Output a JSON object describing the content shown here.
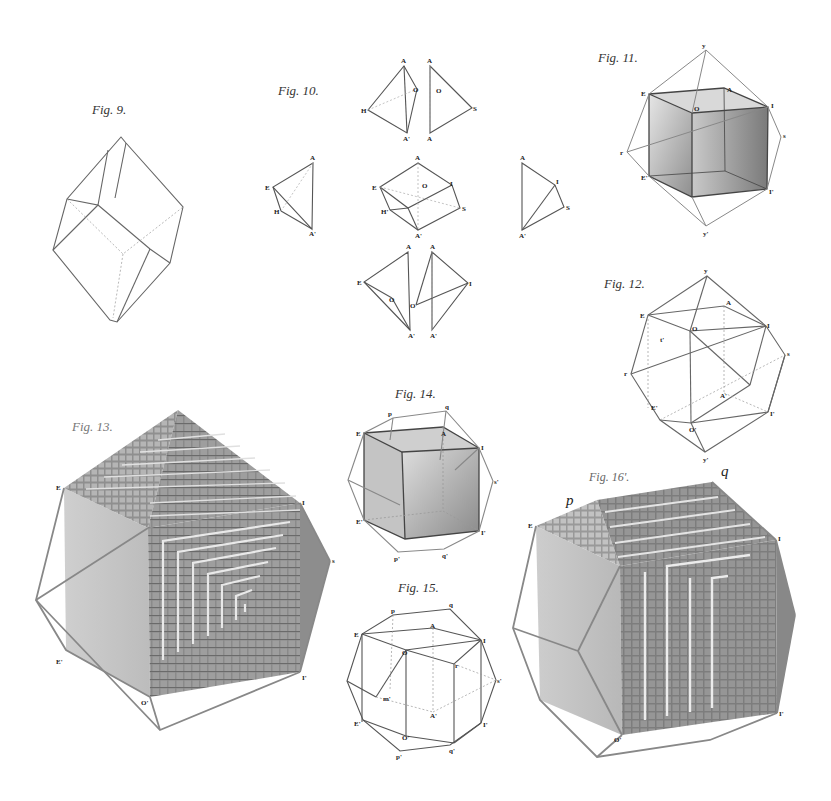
{
  "plate": {
    "subject": "Crystal structure figures",
    "figures": [
      {
        "id": "fig9",
        "label": "Fig. 9.",
        "kind": "rhombic prism outline, dotted hidden edges"
      },
      {
        "id": "fig10",
        "label": "Fig. 10.",
        "kind": "tetrahedral decomposition of octahedron",
        "vertex_labels": [
          "A",
          "A'",
          "O",
          "H",
          "S",
          "E",
          "I",
          "H'"
        ]
      },
      {
        "id": "fig11",
        "label": "Fig. 11.",
        "kind": "shaded cube inscribed in polyhedron",
        "vertex_labels": [
          "E",
          "O",
          "I",
          "E'",
          "I'"
        ]
      },
      {
        "id": "fig12",
        "label": "Fig. 12.",
        "kind": "cuboctahedral wireframe",
        "vertex_labels": [
          "E",
          "A",
          "O",
          "I",
          "E'",
          "I'",
          "A'"
        ]
      },
      {
        "id": "fig13",
        "label": "Fig. 13.",
        "kind": "stepped crystal growth on cube, decrement lamellae",
        "vertex_labels": [
          "E",
          "I",
          "E'",
          "I'",
          "O'"
        ]
      },
      {
        "id": "fig14",
        "label": "Fig. 14.",
        "kind": "shaded cube inscribed in dodecagon outline",
        "vertex_labels": [
          "E",
          "A",
          "I",
          "E'",
          "I'",
          "p'",
          "q'"
        ]
      },
      {
        "id": "fig15",
        "label": "Fig. 15.",
        "kind": "dodecahedral wireframe",
        "vertex_labels": [
          "E",
          "A",
          "O",
          "I",
          "E'",
          "A'",
          "I'",
          "O'",
          "p'",
          "q'"
        ]
      },
      {
        "id": "fig16",
        "label": "Fig. 16'.",
        "kind": "stepped crystal growth with prism faces",
        "vertex_labels": [
          "p",
          "q",
          "O'",
          "I'"
        ]
      }
    ],
    "annotations": {
      "p": "p",
      "q": "q"
    }
  },
  "colors": {
    "ink": "#555555",
    "shade_light": "#c8c8c8",
    "shade_mid": "#9a9a9a",
    "shade_dark": "#6e6e6e",
    "paper": "#ffffff"
  }
}
